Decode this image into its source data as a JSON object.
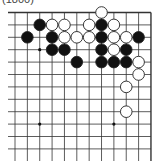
{
  "caption": "(1800)",
  "board": {
    "origin_x": 15,
    "origin_y": 12.5,
    "spacing_x": 12.36,
    "spacing_y": 12.4,
    "cols": 12,
    "rows": 12,
    "edges": {
      "top": true,
      "right": true,
      "left": false,
      "bottom": false
    },
    "line_color": "#333333",
    "star_points": [
      [
        3,
        2
      ],
      [
        9,
        2
      ],
      [
        9,
        8
      ]
    ],
    "stones": [
      {
        "row": 0,
        "col": 7,
        "color": "white"
      },
      {
        "row": 1,
        "col": 2,
        "color": "black"
      },
      {
        "row": 1,
        "col": 3,
        "color": "white"
      },
      {
        "row": 1,
        "col": 4,
        "color": "white"
      },
      {
        "row": 1,
        "col": 6,
        "color": "white"
      },
      {
        "row": 1,
        "col": 7,
        "color": "black"
      },
      {
        "row": 1,
        "col": 8,
        "color": "white"
      },
      {
        "row": 2,
        "col": 1,
        "color": "black"
      },
      {
        "row": 2,
        "col": 3,
        "color": "black"
      },
      {
        "row": 2,
        "col": 4,
        "color": "white"
      },
      {
        "row": 2,
        "col": 5,
        "color": "white"
      },
      {
        "row": 2,
        "col": 6,
        "color": "white"
      },
      {
        "row": 2,
        "col": 7,
        "color": "black"
      },
      {
        "row": 2,
        "col": 8,
        "color": "white"
      },
      {
        "row": 2,
        "col": 9,
        "color": "white"
      },
      {
        "row": 2,
        "col": 10,
        "color": "black"
      },
      {
        "row": 3,
        "col": 3,
        "color": "black"
      },
      {
        "row": 3,
        "col": 4,
        "color": "black"
      },
      {
        "row": 3,
        "col": 7,
        "color": "black"
      },
      {
        "row": 3,
        "col": 8,
        "color": "white"
      },
      {
        "row": 3,
        "col": 9,
        "color": "black"
      },
      {
        "row": 4,
        "col": 5,
        "color": "black"
      },
      {
        "row": 4,
        "col": 7,
        "color": "black"
      },
      {
        "row": 4,
        "col": 8,
        "color": "black"
      },
      {
        "row": 4,
        "col": 9,
        "color": "black"
      },
      {
        "row": 4,
        "col": 10,
        "color": "white"
      },
      {
        "row": 5,
        "col": 10,
        "color": "white"
      },
      {
        "row": 6,
        "col": 9,
        "color": "white"
      },
      {
        "row": 8,
        "col": 9,
        "color": "white"
      }
    ]
  }
}
